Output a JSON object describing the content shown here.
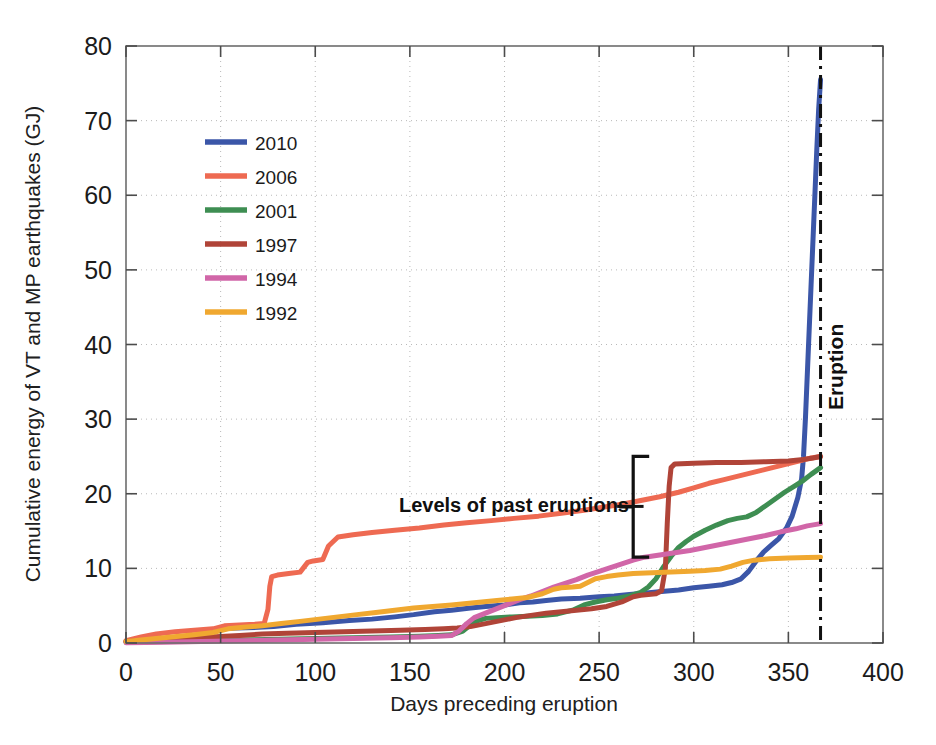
{
  "chart_data": {
    "type": "line",
    "title": "",
    "xlabel": "Days preceding eruption",
    "ylabel": "Cumulative energy of VT and MP earthquakes (GJ)",
    "xlim": [
      0,
      400
    ],
    "ylim": [
      0,
      80
    ],
    "xticks": [
      "0",
      "50",
      "100",
      "150",
      "200",
      "250",
      "300",
      "350",
      "400"
    ],
    "yticks": [
      "0",
      "10",
      "20",
      "30",
      "40",
      "50",
      "60",
      "70",
      "80"
    ],
    "grid": true,
    "legend_position": "upper-left",
    "annotations": [
      {
        "name": "levels-of-past-eruptions",
        "text": "Levels of past eruptions",
        "x": 205,
        "y": 17.5
      },
      {
        "name": "eruption",
        "text": "Eruption",
        "x": 379,
        "y": 37,
        "rotated": true
      }
    ],
    "markers": [
      {
        "name": "eruption-line",
        "type": "vline",
        "x": 367,
        "style": "dash-dot",
        "color": "#111111"
      },
      {
        "name": "past-eruption-brace",
        "type": "brace",
        "x": 268,
        "y_low": 11.5,
        "y_high": 25.0,
        "color": "#111111"
      }
    ],
    "series": [
      {
        "name": "2010",
        "color": "#3b56a8",
        "final_value": 75.5,
        "points": [
          [
            0,
            0.2
          ],
          [
            10,
            0.4
          ],
          [
            22,
            0.6
          ],
          [
            35,
            0.9
          ],
          [
            44,
            1.1
          ],
          [
            50,
            1.9
          ],
          [
            58,
            2.0
          ],
          [
            70,
            2.1
          ],
          [
            78,
            2.2
          ],
          [
            90,
            2.5
          ],
          [
            104,
            2.7
          ],
          [
            118,
            3.0
          ],
          [
            130,
            3.2
          ],
          [
            142,
            3.5
          ],
          [
            152,
            3.8
          ],
          [
            163,
            4.2
          ],
          [
            172,
            4.4
          ],
          [
            182,
            4.7
          ],
          [
            190,
            4.9
          ],
          [
            200,
            5.1
          ],
          [
            208,
            5.4
          ],
          [
            215,
            5.5
          ],
          [
            222,
            5.7
          ],
          [
            230,
            5.9
          ],
          [
            240,
            6.0
          ],
          [
            250,
            6.2
          ],
          [
            258,
            6.3
          ],
          [
            266,
            6.5
          ],
          [
            275,
            6.7
          ],
          [
            283,
            6.9
          ],
          [
            292,
            7.1
          ],
          [
            300,
            7.4
          ],
          [
            308,
            7.6
          ],
          [
            315,
            7.8
          ],
          [
            320,
            8.1
          ],
          [
            325,
            8.6
          ],
          [
            329,
            9.6
          ],
          [
            333,
            11.0
          ],
          [
            337,
            12.2
          ],
          [
            341,
            13.1
          ],
          [
            345,
            14.0
          ],
          [
            349,
            15.4
          ],
          [
            352,
            17.0
          ],
          [
            355,
            19.5
          ],
          [
            357,
            22.0
          ],
          [
            358,
            25.0
          ],
          [
            359,
            30.0
          ],
          [
            360,
            36.0
          ],
          [
            361,
            42.0
          ],
          [
            362,
            48.0
          ],
          [
            363,
            54.0
          ],
          [
            364,
            60.0
          ],
          [
            365,
            66.0
          ],
          [
            366,
            71.5
          ],
          [
            367,
            75.5
          ]
        ]
      },
      {
        "name": "2006",
        "color": "#ee6a52",
        "final_value": 25.0,
        "points": [
          [
            0,
            0.3
          ],
          [
            8,
            0.8
          ],
          [
            16,
            1.2
          ],
          [
            26,
            1.5
          ],
          [
            36,
            1.7
          ],
          [
            46,
            1.9
          ],
          [
            52,
            2.3
          ],
          [
            60,
            2.4
          ],
          [
            68,
            2.5
          ],
          [
            73,
            2.6
          ],
          [
            75,
            4.5
          ],
          [
            76,
            7.6
          ],
          [
            77,
            8.9
          ],
          [
            80,
            9.1
          ],
          [
            86,
            9.3
          ],
          [
            92,
            9.5
          ],
          [
            96,
            10.8
          ],
          [
            99,
            11.0
          ],
          [
            104,
            11.2
          ],
          [
            107,
            13.0
          ],
          [
            112,
            14.2
          ],
          [
            120,
            14.5
          ],
          [
            130,
            14.8
          ],
          [
            142,
            15.1
          ],
          [
            155,
            15.4
          ],
          [
            168,
            15.8
          ],
          [
            180,
            16.1
          ],
          [
            193,
            16.4
          ],
          [
            205,
            16.7
          ],
          [
            218,
            17.0
          ],
          [
            230,
            17.4
          ],
          [
            242,
            17.8
          ],
          [
            252,
            18.2
          ],
          [
            262,
            18.6
          ],
          [
            272,
            19.1
          ],
          [
            282,
            19.6
          ],
          [
            292,
            20.2
          ],
          [
            300,
            20.8
          ],
          [
            308,
            21.4
          ],
          [
            316,
            21.9
          ],
          [
            324,
            22.4
          ],
          [
            332,
            22.9
          ],
          [
            340,
            23.4
          ],
          [
            348,
            23.9
          ],
          [
            356,
            24.4
          ],
          [
            362,
            24.8
          ],
          [
            367,
            25.0
          ]
        ]
      },
      {
        "name": "2001",
        "color": "#3e8e52",
        "final_value": 23.5,
        "points": [
          [
            0,
            0.1
          ],
          [
            20,
            0.2
          ],
          [
            40,
            0.3
          ],
          [
            60,
            0.4
          ],
          [
            80,
            0.5
          ],
          [
            100,
            0.6
          ],
          [
            120,
            0.7
          ],
          [
            140,
            0.8
          ],
          [
            155,
            0.9
          ],
          [
            165,
            1.0
          ],
          [
            172,
            1.1
          ],
          [
            178,
            1.6
          ],
          [
            182,
            2.4
          ],
          [
            186,
            3.0
          ],
          [
            190,
            3.3
          ],
          [
            196,
            3.4
          ],
          [
            204,
            3.5
          ],
          [
            212,
            3.6
          ],
          [
            220,
            3.7
          ],
          [
            228,
            3.9
          ],
          [
            236,
            4.4
          ],
          [
            242,
            5.1
          ],
          [
            248,
            5.5
          ],
          [
            254,
            5.8
          ],
          [
            260,
            6.0
          ],
          [
            266,
            6.3
          ],
          [
            272,
            6.8
          ],
          [
            276,
            7.5
          ],
          [
            280,
            8.6
          ],
          [
            284,
            10.2
          ],
          [
            288,
            11.6
          ],
          [
            292,
            12.8
          ],
          [
            296,
            13.6
          ],
          [
            300,
            14.3
          ],
          [
            306,
            15.1
          ],
          [
            312,
            15.8
          ],
          [
            318,
            16.4
          ],
          [
            323,
            16.7
          ],
          [
            328,
            16.9
          ],
          [
            333,
            17.5
          ],
          [
            338,
            18.4
          ],
          [
            343,
            19.3
          ],
          [
            348,
            20.2
          ],
          [
            353,
            21.0
          ],
          [
            358,
            21.8
          ],
          [
            362,
            22.6
          ],
          [
            367,
            23.5
          ]
        ]
      },
      {
        "name": "1997",
        "color": "#b04438",
        "final_value": 25.0,
        "points": [
          [
            0,
            0.2
          ],
          [
            15,
            0.4
          ],
          [
            30,
            0.6
          ],
          [
            45,
            0.8
          ],
          [
            60,
            1.0
          ],
          [
            72,
            1.2
          ],
          [
            85,
            1.3
          ],
          [
            100,
            1.4
          ],
          [
            115,
            1.5
          ],
          [
            130,
            1.6
          ],
          [
            145,
            1.7
          ],
          [
            158,
            1.8
          ],
          [
            168,
            1.9
          ],
          [
            175,
            2.0
          ],
          [
            182,
            2.2
          ],
          [
            190,
            2.6
          ],
          [
            198,
            3.0
          ],
          [
            206,
            3.4
          ],
          [
            214,
            3.7
          ],
          [
            222,
            4.0
          ],
          [
            230,
            4.2
          ],
          [
            238,
            4.4
          ],
          [
            246,
            4.6
          ],
          [
            254,
            4.9
          ],
          [
            262,
            5.5
          ],
          [
            268,
            6.2
          ],
          [
            272,
            6.4
          ],
          [
            276,
            6.5
          ],
          [
            280,
            6.6
          ],
          [
            283,
            7.0
          ],
          [
            285,
            10.0
          ],
          [
            286,
            16.0
          ],
          [
            287,
            21.0
          ],
          [
            288,
            23.5
          ],
          [
            290,
            24.0
          ],
          [
            300,
            24.1
          ],
          [
            312,
            24.2
          ],
          [
            325,
            24.2
          ],
          [
            338,
            24.3
          ],
          [
            350,
            24.4
          ],
          [
            358,
            24.6
          ],
          [
            363,
            24.8
          ],
          [
            367,
            25.0
          ]
        ]
      },
      {
        "name": "1994",
        "color": "#d166a8",
        "final_value": 16.0,
        "points": [
          [
            0,
            0.05
          ],
          [
            20,
            0.1
          ],
          [
            40,
            0.2
          ],
          [
            60,
            0.3
          ],
          [
            80,
            0.4
          ],
          [
            100,
            0.5
          ],
          [
            120,
            0.6
          ],
          [
            140,
            0.7
          ],
          [
            155,
            0.8
          ],
          [
            165,
            0.9
          ],
          [
            172,
            1.0
          ],
          [
            176,
            1.6
          ],
          [
            180,
            2.6
          ],
          [
            184,
            3.4
          ],
          [
            190,
            4.0
          ],
          [
            196,
            4.6
          ],
          [
            202,
            5.2
          ],
          [
            208,
            5.8
          ],
          [
            214,
            6.3
          ],
          [
            220,
            6.9
          ],
          [
            226,
            7.5
          ],
          [
            232,
            8.0
          ],
          [
            238,
            8.5
          ],
          [
            244,
            9.1
          ],
          [
            250,
            9.6
          ],
          [
            256,
            10.1
          ],
          [
            262,
            10.6
          ],
          [
            268,
            11.1
          ],
          [
            274,
            11.5
          ],
          [
            282,
            11.8
          ],
          [
            290,
            12.1
          ],
          [
            298,
            12.4
          ],
          [
            306,
            12.8
          ],
          [
            314,
            13.2
          ],
          [
            322,
            13.6
          ],
          [
            330,
            14.0
          ],
          [
            338,
            14.4
          ],
          [
            346,
            14.9
          ],
          [
            354,
            15.3
          ],
          [
            360,
            15.7
          ],
          [
            367,
            16.0
          ]
        ]
      },
      {
        "name": "1992",
        "color": "#f0a830",
        "final_value": 11.5,
        "points": [
          [
            0,
            0.2
          ],
          [
            12,
            0.5
          ],
          [
            24,
            0.8
          ],
          [
            36,
            1.1
          ],
          [
            46,
            1.4
          ],
          [
            54,
            1.9
          ],
          [
            62,
            2.1
          ],
          [
            72,
            2.3
          ],
          [
            82,
            2.6
          ],
          [
            92,
            2.9
          ],
          [
            102,
            3.2
          ],
          [
            112,
            3.5
          ],
          [
            122,
            3.8
          ],
          [
            132,
            4.1
          ],
          [
            142,
            4.4
          ],
          [
            152,
            4.7
          ],
          [
            162,
            4.9
          ],
          [
            172,
            5.1
          ],
          [
            180,
            5.3
          ],
          [
            188,
            5.5
          ],
          [
            196,
            5.7
          ],
          [
            204,
            5.9
          ],
          [
            212,
            6.1
          ],
          [
            220,
            6.6
          ],
          [
            226,
            7.2
          ],
          [
            230,
            7.4
          ],
          [
            236,
            7.5
          ],
          [
            240,
            7.6
          ],
          [
            244,
            8.1
          ],
          [
            248,
            8.6
          ],
          [
            254,
            8.9
          ],
          [
            260,
            9.1
          ],
          [
            268,
            9.3
          ],
          [
            278,
            9.4
          ],
          [
            288,
            9.5
          ],
          [
            298,
            9.6
          ],
          [
            306,
            9.7
          ],
          [
            314,
            9.9
          ],
          [
            320,
            10.3
          ],
          [
            326,
            10.8
          ],
          [
            332,
            11.1
          ],
          [
            340,
            11.3
          ],
          [
            350,
            11.4
          ],
          [
            360,
            11.45
          ],
          [
            367,
            11.5
          ]
        ]
      }
    ]
  },
  "legend": {
    "items": [
      {
        "label": "2010",
        "color": "#3b56a8"
      },
      {
        "label": "2006",
        "color": "#ee6a52"
      },
      {
        "label": "2001",
        "color": "#3e8e52"
      },
      {
        "label": "1997",
        "color": "#b04438"
      },
      {
        "label": "1994",
        "color": "#d166a8"
      },
      {
        "label": "1992",
        "color": "#f0a830"
      }
    ]
  }
}
